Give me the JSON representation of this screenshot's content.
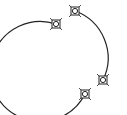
{
  "diagram": {
    "background": "#ffffff",
    "stroke_color": "#222222",
    "circle": {
      "cx": 65,
      "cy": 58,
      "r": 50
    },
    "arcs": [
      {
        "name": "left-arc",
        "from": [
          56,
          24
        ],
        "to": [
          85,
          94
        ],
        "sweep": 0,
        "large": 1
      },
      {
        "name": "right-arc",
        "from": [
          75,
          11
        ],
        "to": [
          103,
          80
        ],
        "sweep": 1,
        "large": 0
      }
    ],
    "handles": [
      {
        "name": "handle-top-left",
        "x": 56,
        "y": 24
      },
      {
        "name": "handle-top",
        "x": 75,
        "y": 11
      },
      {
        "name": "handle-right",
        "x": 103,
        "y": 80
      },
      {
        "name": "handle-bottom",
        "x": 85,
        "y": 94
      }
    ]
  }
}
